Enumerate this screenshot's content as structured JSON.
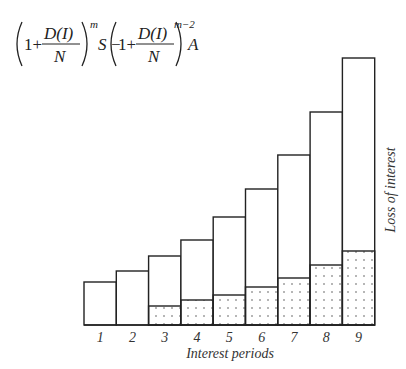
{
  "formula": {
    "term1_num": "D(I)",
    "term1_den": "N",
    "term1_exp": "m",
    "term1_var": "S",
    "minus": "−",
    "term2_num": "D(I)",
    "term2_den": "N",
    "term2_exp": "m−2",
    "term2_var": "A",
    "one_plus": "1+"
  },
  "chart_data": {
    "type": "bar",
    "title": "",
    "xlabel": "Interest periods",
    "ylabel": "Loss of interest",
    "categories": [
      "1",
      "2",
      "3",
      "4",
      "5",
      "6",
      "7",
      "8",
      "9"
    ],
    "series": [
      {
        "name": "total (outline)",
        "values": [
          43,
          54,
          69,
          85,
          108,
          136,
          170,
          213,
          267
        ]
      },
      {
        "name": "loss of interest (dotted)",
        "values": [
          0,
          0,
          19,
          25,
          30,
          38,
          47,
          60,
          74
        ]
      }
    ],
    "grid": false,
    "legend": "none"
  },
  "axis": {
    "xlabel": "Interest periods",
    "ylabel": "Loss of interest"
  }
}
